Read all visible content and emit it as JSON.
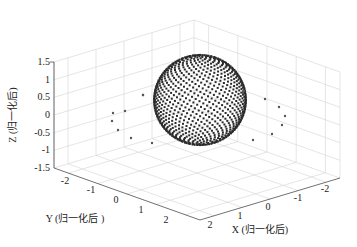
{
  "chart_data": {
    "type": "scatter3d",
    "title": "",
    "xlabel": "X (归一化后)",
    "ylabel": "Y (归一化后 )",
    "zlabel": "Z (归一化后)",
    "xlim": [
      -2.5,
      2.5
    ],
    "ylim": [
      -2.5,
      2.5
    ],
    "zlim": [
      -1.5,
      1.5
    ],
    "xticks": [
      "2",
      "1",
      "0",
      "-1",
      "-2"
    ],
    "yticks": [
      "-2",
      "-1",
      "0",
      "1",
      "2"
    ],
    "zticks": [
      "1.5",
      "1",
      "0.5",
      "0",
      "-0.5",
      "-1",
      "-1.5"
    ],
    "grid": true,
    "series": [
      {
        "name": "sphere points",
        "description": "dense points on unit sphere centered at origin",
        "center": [
          0,
          0,
          0
        ],
        "radius": 1,
        "color": "#2b2b2b"
      },
      {
        "name": "outlier points (left)",
        "count": 8,
        "color": "#555555"
      },
      {
        "name": "outlier points (right)",
        "count": 8,
        "color": "#555555"
      }
    ]
  },
  "watermark": "..."
}
